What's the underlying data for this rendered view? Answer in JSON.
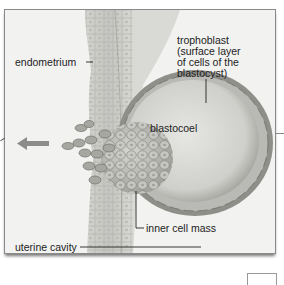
{
  "figure": {
    "labels": {
      "endometrium": "endometrium",
      "trophoblast_line1": "trophoblast",
      "trophoblast_line2": "(surface layer",
      "trophoblast_line3": "of cells of the",
      "trophoblast_line4": "blastocyst)",
      "blastocoel": "blastocoel",
      "inner_cell_mass": "inner cell mass",
      "uterine_cavity": "uterine cavity"
    },
    "arrow_direction": "left",
    "colors": {
      "background": "#f2f2f1",
      "tissue_light": "#d9d9d6",
      "tissue_mid": "#bdbdb9",
      "tissue_dark": "#8f8f8a",
      "arrow": "#8c8c8c",
      "leader_line": "#222222",
      "frame_border": "#8a8a8a"
    }
  }
}
